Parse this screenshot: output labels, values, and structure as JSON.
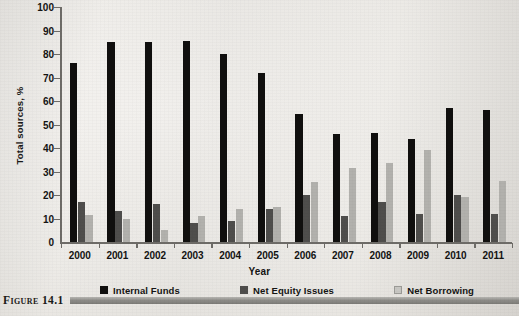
{
  "figure": {
    "caption_label": "Figure 14.1"
  },
  "chart_data": {
    "type": "bar",
    "title": "",
    "xlabel": "Year",
    "ylabel": "Total sources, %",
    "ylim": [
      0,
      100
    ],
    "ytick_step": 10,
    "grid": false,
    "legend_position": "bottom",
    "categories": [
      "2000",
      "2001",
      "2002",
      "2003",
      "2004",
      "2005",
      "2006",
      "2007",
      "2008",
      "2009",
      "2010",
      "2011"
    ],
    "yticks": [
      "0",
      "10",
      "20",
      "30",
      "40",
      "50",
      "60",
      "70",
      "80",
      "90",
      "100"
    ],
    "series": [
      {
        "name": "Internal Funds",
        "color": "#100f0e",
        "values": [
          76,
          85,
          85,
          85.5,
          80,
          72,
          54.5,
          46,
          46.5,
          44,
          57,
          56
        ]
      },
      {
        "name": "Net Equity Issues",
        "color": "#4f4e4c",
        "values": [
          17,
          13,
          16,
          8,
          9,
          14,
          20,
          11,
          17,
          12,
          20,
          12
        ]
      },
      {
        "name": "Net Borrowing",
        "color": "#b2b1ad",
        "values": [
          11.5,
          10,
          5,
          11,
          14,
          15,
          25.5,
          31.5,
          33.5,
          39,
          19,
          26
        ]
      }
    ]
  }
}
